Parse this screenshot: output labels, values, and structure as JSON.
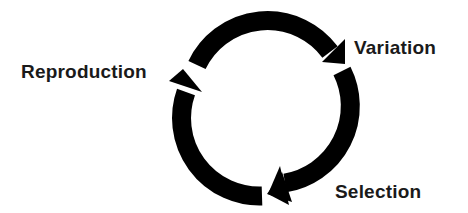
{
  "diagram": {
    "type": "cycle",
    "title": "",
    "nodes": [
      {
        "id": "variation",
        "label": "Variation"
      },
      {
        "id": "selection",
        "label": "Selection"
      },
      {
        "id": "reproduction",
        "label": "Reproduction"
      }
    ],
    "edges": [
      {
        "from": "reproduction",
        "to": "variation",
        "direction": "clockwise"
      },
      {
        "from": "variation",
        "to": "selection",
        "direction": "clockwise"
      },
      {
        "from": "selection",
        "to": "reproduction",
        "direction": "clockwise"
      }
    ],
    "colors": {
      "arrow": "#000000",
      "text": "#1a1a1a",
      "background": "#ffffff"
    }
  }
}
